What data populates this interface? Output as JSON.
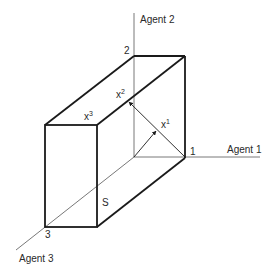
{
  "diagram": {
    "type": "3d-box-allocation",
    "axes": {
      "agent1": "Agent 1",
      "agent2": "Agent 2",
      "agent3": "Agent 3"
    },
    "vertex_labels": {
      "v1": "1",
      "v2": "2",
      "v3": "3"
    },
    "region_label": "S",
    "allocations": {
      "x1_base": "x",
      "x1_sup": "1",
      "x2_base": "x",
      "x2_sup": "2",
      "x3_base": "x",
      "x3_sup": "3"
    },
    "colors": {
      "line": "#1a1a1a",
      "thin_line": "#555555",
      "background": "#ffffff"
    }
  }
}
